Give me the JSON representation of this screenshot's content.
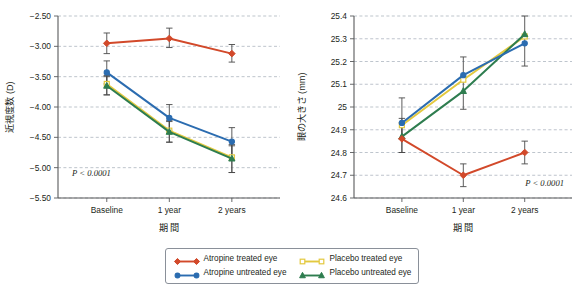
{
  "figure": {
    "background": "#ffffff",
    "grid_color": "#9aa4b0",
    "axis_color": "#58595b",
    "text_color": "#231f20"
  },
  "series_styles": [
    {
      "key": "atropine_treated",
      "color": "#D2492A",
      "marker": "diamond",
      "filled": true
    },
    {
      "key": "atropine_untreated",
      "color": "#2B6CB0",
      "marker": "circle",
      "filled": true
    },
    {
      "key": "placebo_treated",
      "color": "#E3C93F",
      "marker": "square",
      "filled": false
    },
    {
      "key": "placebo_untreated",
      "color": "#2E7D4F",
      "marker": "triangle",
      "filled": true
    }
  ],
  "legend": {
    "items": [
      {
        "label": "Atropine treated eye",
        "key": "atropine_treated"
      },
      {
        "label": "Placebo treated eye",
        "key": "placebo_treated"
      },
      {
        "label": "Atropine untreated eye",
        "key": "atropine_untreated"
      },
      {
        "label": "Placebo untreated eye",
        "key": "placebo_untreated"
      }
    ]
  },
  "chart_data": [
    {
      "id": "refractive-error",
      "type": "line",
      "title": "",
      "xlabel": "期 間",
      "ylabel": "近視度数 (D)",
      "annotation": "P < 0.0001",
      "annotation_position": "bottom-left",
      "grid": true,
      "categories": [
        "Baseline",
        "1 year",
        "2 years"
      ],
      "ylim": [
        -5.5,
        -2.5
      ],
      "yticks": [
        -2.5,
        -3.0,
        -3.5,
        -4.0,
        -4.5,
        -5.0,
        -5.5
      ],
      "ytick_labels": [
        "−2.50",
        "−3.00",
        "−3.50",
        "−4.00",
        "−4.50",
        "−5.00",
        "−5.50"
      ],
      "series": [
        {
          "name": "Atropine treated eye",
          "key": "atropine_treated",
          "values": [
            -2.95,
            -2.87,
            -3.12
          ],
          "err_low": [
            -3.12,
            -3.02,
            -3.26
          ],
          "err_high": [
            -2.78,
            -2.7,
            -2.97
          ]
        },
        {
          "name": "Atropine untreated eye",
          "key": "atropine_untreated",
          "values": [
            -3.43,
            -4.18,
            -4.57
          ],
          "err_low": [
            -3.62,
            -4.4,
            -4.8
          ],
          "err_high": [
            -3.24,
            -3.96,
            -4.34
          ]
        },
        {
          "name": "Placebo treated eye",
          "key": "placebo_treated",
          "values": [
            -3.62,
            -4.39,
            -4.83
          ],
          "err_low": [
            -3.8,
            -4.58,
            -5.08
          ],
          "err_high": [
            -3.48,
            -4.22,
            -4.62
          ]
        },
        {
          "name": "Placebo untreated eye",
          "key": "placebo_untreated",
          "values": [
            -3.65,
            -4.41,
            -4.85
          ],
          "err_low": [
            -3.8,
            -4.58,
            -5.08
          ],
          "err_high": [
            -3.5,
            -4.24,
            -4.64
          ]
        }
      ]
    },
    {
      "id": "axial-length",
      "type": "line",
      "title": "",
      "xlabel": "期 間",
      "ylabel": "眼の大きさ (mm)",
      "annotation": "P < 0.0001",
      "annotation_position": "bottom-right",
      "grid": true,
      "categories": [
        "Baseline",
        "1 year",
        "2 years"
      ],
      "ylim": [
        24.6,
        25.4
      ],
      "yticks": [
        25.4,
        25.3,
        25.2,
        25.1,
        25.0,
        24.9,
        24.8,
        24.7,
        24.6
      ],
      "ytick_labels": [
        "25.4",
        "25.3",
        "25.2",
        "25.1",
        "25",
        "24.9",
        "24.8",
        "24.7",
        "24.6"
      ],
      "series": [
        {
          "name": "Atropine treated eye",
          "key": "atropine_treated",
          "values": [
            24.86,
            24.7,
            24.8
          ],
          "err_low": [
            24.8,
            24.65,
            24.75
          ],
          "err_high": [
            24.93,
            24.75,
            24.85
          ]
        },
        {
          "name": "Atropine untreated eye",
          "key": "atropine_untreated",
          "values": [
            24.93,
            25.14,
            25.28
          ],
          "err_low": [
            24.86,
            24.99,
            25.18
          ],
          "err_high": [
            25.04,
            25.22,
            25.4
          ]
        },
        {
          "name": "Placebo treated eye",
          "key": "placebo_treated",
          "values": [
            24.92,
            25.12,
            25.31
          ],
          "err_low": [
            24.86,
            24.99,
            25.18
          ],
          "err_high": [
            25.04,
            25.22,
            25.4
          ]
        },
        {
          "name": "Placebo untreated eye",
          "key": "placebo_untreated",
          "values": [
            24.87,
            25.07,
            25.32
          ],
          "err_low": [
            24.8,
            24.99,
            25.18
          ],
          "err_high": [
            24.95,
            25.22,
            25.4
          ]
        }
      ]
    }
  ]
}
